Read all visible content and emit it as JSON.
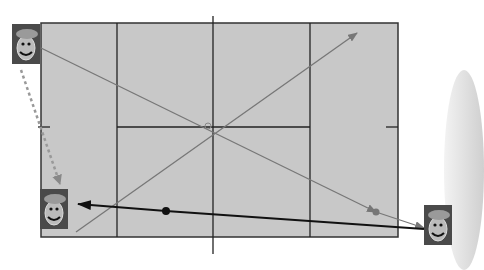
{
  "diagram": {
    "field": {
      "x": 41,
      "y": 23,
      "width": 357,
      "height": 214,
      "fill": "#c8c8c8",
      "border": "#333333"
    },
    "grid": {
      "vertical_lines_x": [
        117,
        310
      ],
      "center_vertical_x": 213,
      "center_vertical_extends": [
        16,
        254
      ],
      "horizontal_line": {
        "y": 127,
        "x1": 117,
        "x2": 310
      },
      "edge_ticks": [
        {
          "x1": 38,
          "x2": 48,
          "y": 127
        },
        {
          "x1": 386,
          "x2": 398,
          "y": 127
        }
      ]
    },
    "tiles": [
      {
        "id": "tile-top-left",
        "x": 12,
        "y": 24,
        "label": "player-a"
      },
      {
        "id": "tile-bottom-left",
        "x": 40,
        "y": 189,
        "label": "player-b"
      },
      {
        "id": "tile-bottom-right",
        "x": 424,
        "y": 205,
        "label": "player-c"
      }
    ],
    "paths": [
      {
        "id": "grey-diag-down",
        "from": [
          41,
          48
        ],
        "to": [
          376,
          212
        ],
        "color": "#777777",
        "arrow": "end",
        "width": 1.3
      },
      {
        "id": "grey-diag-up",
        "from": [
          76,
          232
        ],
        "to": [
          357,
          33
        ],
        "color": "#777777",
        "arrow": "end",
        "width": 1.3
      },
      {
        "id": "dashed-drop",
        "from": [
          21,
          70
        ],
        "to": [
          60,
          184
        ],
        "color": "#888888",
        "arrow": "end",
        "dashed": true,
        "width": 2
      },
      {
        "id": "black-main",
        "from": [
          424,
          228
        ],
        "to": [
          78,
          232
        ],
        "color": "#111111",
        "arrow": "end",
        "width": 1.8,
        "via": [
          166,
          211
        ]
      }
    ],
    "points": [
      {
        "id": "black-dot",
        "x": 166,
        "y": 211,
        "r": 4,
        "color": "#111111"
      },
      {
        "id": "grey-dot",
        "x": 376,
        "y": 212,
        "r": 3.5,
        "color": "#777777"
      },
      {
        "id": "center-marker",
        "x": 208,
        "y": 126,
        "r": 3,
        "color": "#888888"
      }
    ]
  }
}
